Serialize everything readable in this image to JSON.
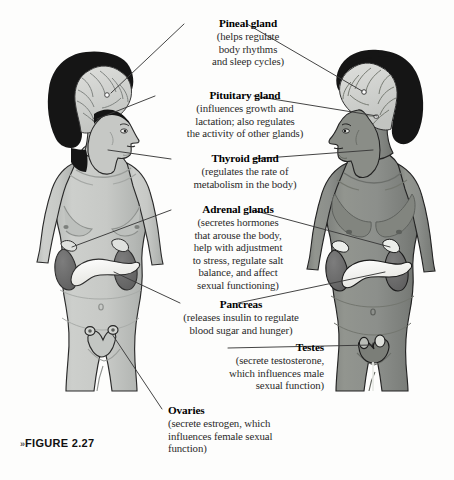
{
  "figure": {
    "caption_marker": "»",
    "caption_label": "FIGURE 2.27"
  },
  "colors": {
    "background": "#fdfdfc",
    "ink": "#1b1b1b",
    "body_text": "#2a2a2a",
    "female_skin": "#c9cbc8",
    "female_skin_shadow": "#b0b3b0",
    "male_skin": "#8d908c",
    "male_skin_shadow": "#757874",
    "hair": "#151515",
    "brain": "#cfd1ce",
    "brain_line": "#6e7270",
    "kidney": "#6a6a6a",
    "adrenal": "#d9dbd8",
    "pancreas": "#f7f7f4",
    "leader_line": "#3a3a3a"
  },
  "labels": [
    {
      "id": "pineal",
      "title": "Pineal gland",
      "lines": [
        "(helps regulate",
        "body rhythms",
        "and sleep cycles)"
      ],
      "align": "center"
    },
    {
      "id": "pituitary",
      "title": "Pituitary gland",
      "lines": [
        "(influences growth and",
        "lactation; also regulates",
        "the activity of other glands)"
      ],
      "align": "center"
    },
    {
      "id": "thyroid",
      "title": "Thyroid gland",
      "lines": [
        "(regulates the rate of",
        "metabolism in the body)"
      ],
      "align": "center"
    },
    {
      "id": "adrenal",
      "title": "Adrenal glands",
      "lines": [
        "(secretes hormones",
        "that arouse the body,",
        "help with adjustment",
        "to stress, regulate salt",
        "balance, and affect",
        "sexual functioning)"
      ],
      "align": "center"
    },
    {
      "id": "pancreas",
      "title": "Pancreas",
      "lines": [
        "(releases insulin to regulate",
        "blood sugar and hunger)"
      ],
      "align": "center"
    },
    {
      "id": "testes",
      "title": "Testes",
      "lines": [
        "(secrete testosterone,",
        "which influences male",
        "sexual function)"
      ],
      "align": "right"
    },
    {
      "id": "ovaries",
      "title": "Ovaries",
      "lines": [
        "(secrete estrogen, which",
        "influences female sexual",
        "function)"
      ],
      "align": "left"
    }
  ],
  "anatomy": {
    "figures": [
      {
        "id": "female",
        "sex": "female",
        "facing": "right",
        "skin": "light"
      },
      {
        "id": "male",
        "sex": "male",
        "facing": "left",
        "skin": "dark"
      }
    ],
    "organs": [
      "brain",
      "pineal gland",
      "pituitary gland",
      "thyroid gland",
      "adrenal glands",
      "kidneys",
      "pancreas",
      "ovaries",
      "uterus",
      "testes"
    ]
  }
}
